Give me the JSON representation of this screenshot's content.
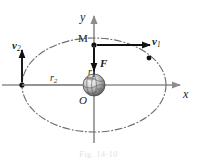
{
  "figure": {
    "caption": "Fig. 14-10",
    "axes": {
      "y_label": "y",
      "x_label": "x",
      "origin_label": "O"
    },
    "labels": {
      "satellite": "M",
      "force": "F",
      "radius_near": "r",
      "radius_near_sub": "1",
      "radius_far": "r",
      "radius_far_sub": "2",
      "velocity_near": "v",
      "velocity_near_sub": "1",
      "velocity_far": "v",
      "velocity_far_sub": "2"
    },
    "colors": {
      "axis": "#8d8d8d",
      "orbit": "#6e6e6e",
      "vector": "#111111",
      "marker": "#111111",
      "planet_light": "#f2f2f2",
      "planet_mid": "#9a9a9a",
      "planet_dark": "#4a4a4a",
      "text": "#1b1b1b",
      "caption": "#e2e2e2"
    },
    "geometry": {
      "center_x": 94,
      "center_y": 85,
      "orbit_rx": 72,
      "orbit_ry": 47,
      "planet_radius": 11,
      "marker_apogee": {
        "x": 22,
        "y": 85
      },
      "marker_perigee": {
        "x": 94,
        "y": 45
      },
      "marker_orbit_point": {
        "x": 149,
        "y": 58
      }
    }
  }
}
